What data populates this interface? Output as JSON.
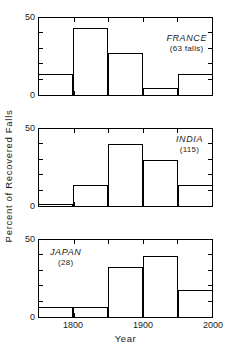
{
  "chart_data": {
    "type": "bar",
    "title": "",
    "subtitle": "",
    "xlabel": "Year",
    "ylabel": "Percent of Recovered Falls",
    "xlim": [
      1750,
      2000
    ],
    "ylim": [
      0,
      50
    ],
    "xticks": [
      1800,
      1900,
      2000
    ],
    "xtick_labels": [
      "1800",
      "1900",
      "2000"
    ],
    "xticks_minor": [
      1750,
      1850,
      1950
    ],
    "yticks": [
      0,
      50
    ],
    "ytick_labels": [
      "0",
      "50"
    ],
    "yticks_minor": [
      10,
      20,
      30,
      40
    ],
    "grid": false,
    "legend": false,
    "bin_edges": [
      1750,
      1800,
      1850,
      1900,
      1950,
      2000
    ],
    "bin_width": 50,
    "panels": [
      {
        "id": "france",
        "country": "FRANCE",
        "count_label": "(63 falls)",
        "total_falls": 63,
        "categories": [
          "1750-1800",
          "1800-1850",
          "1850-1900",
          "1900-1950",
          "1950-2000"
        ],
        "values": [
          14,
          43,
          27,
          5,
          14
        ]
      },
      {
        "id": "india",
        "country": "INDIA",
        "count_label": "(115)",
        "total_falls": 115,
        "categories": [
          "1750-1800",
          "1800-1850",
          "1850-1900",
          "1900-1950",
          "1950-2000"
        ],
        "values": [
          2,
          14,
          40,
          30,
          14
        ]
      },
      {
        "id": "japan",
        "country": "JAPAN",
        "count_label": "(28)",
        "total_falls": 28,
        "categories": [
          "1750-1800",
          "1800-1850",
          "1850-1900",
          "1900-1950",
          "1950-2000"
        ],
        "values": [
          7,
          7,
          32,
          39,
          18
        ]
      }
    ]
  },
  "axis": {
    "y_title": "Percent of Recovered Falls",
    "x_title": "Year",
    "y_max_label": "50",
    "y_min_label": "0",
    "x_labels": [
      "1800",
      "1900",
      "2000"
    ]
  },
  "colors": {
    "ink": "#000000",
    "background": "#ffffff"
  }
}
